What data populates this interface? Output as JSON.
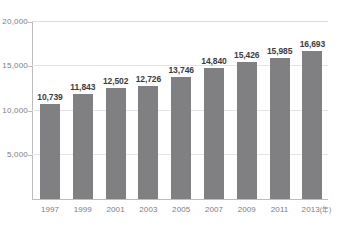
{
  "chart_data": {
    "type": "bar",
    "title": "",
    "xlabel": "",
    "ylabel": "",
    "x_unit_suffix": "(年)",
    "ylim": [
      0,
      20000
    ],
    "y_ticks": [
      "5,000",
      "10,000",
      "15,000",
      "20,000"
    ],
    "y_tick_values": [
      5000,
      10000,
      15000,
      20000
    ],
    "grid": true,
    "legend": "none",
    "bar_color": "#808082",
    "categories": [
      "1997",
      "1999",
      "2001",
      "2003",
      "2005",
      "2007",
      "2009",
      "2011",
      "2013"
    ],
    "values": [
      10739,
      11843,
      12502,
      12726,
      13746,
      14840,
      15426,
      15985,
      16693
    ],
    "value_labels": [
      "10,739",
      "11,843",
      "12,502",
      "12,726",
      "13,746",
      "14,840",
      "15,426",
      "15,985",
      "16,693"
    ]
  }
}
